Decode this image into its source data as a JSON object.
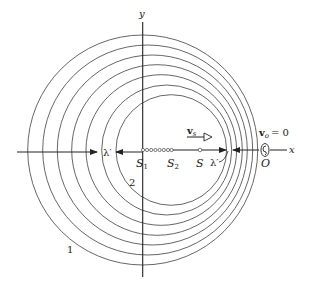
{
  "diagram": {
    "axes": {
      "x_label": "x",
      "y_label": "y"
    },
    "source_positions": {
      "s1_label": "S",
      "s1_sub": "1",
      "s2_label": "S",
      "s2_sub": "2",
      "s_label": "S"
    },
    "wavelength_left_label": "λ′",
    "wavelength_right_label": "λ′",
    "source_velocity": {
      "label": "v",
      "sub": "s"
    },
    "observer": {
      "velocity_label": "v",
      "velocity_sub": "o",
      "velocity_value": "= 0",
      "label": "O",
      "icon": "ear-icon"
    },
    "wavefront_labels": {
      "outer": "1",
      "inner": "2"
    },
    "wavefronts": [
      {
        "cx": 142.7,
        "r": 115
      },
      {
        "cx": 147.7,
        "r": 105
      },
      {
        "cx": 152.3,
        "r": 95
      },
      {
        "cx": 157.0,
        "r": 85.3
      },
      {
        "cx": 161.3,
        "r": 75.3
      },
      {
        "cx": 166.7,
        "r": 65
      },
      {
        "cx": 171.3,
        "r": 55.3
      }
    ],
    "colors": {
      "line": "#333333",
      "circle": "#555555",
      "background": "#ffffff"
    }
  }
}
